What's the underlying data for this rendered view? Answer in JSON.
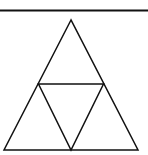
{
  "diagram": {
    "type": "subdivided-triangle",
    "stroke_color": "#111111",
    "background": "#ffffff",
    "top_rule": {
      "x1": 0,
      "y1": 10.5,
      "x2": 148,
      "y2": 10.5,
      "width": 2.2
    },
    "outer_triangle": {
      "apex": [
        71,
        20
      ],
      "bottom_left": [
        4,
        150
      ],
      "bottom_right": [
        138,
        150
      ]
    },
    "midline": {
      "left": [
        38.5,
        84
      ],
      "right": [
        103.5,
        84
      ]
    },
    "bottom_mid": [
      71,
      150
    ],
    "line_width": 1.5
  }
}
